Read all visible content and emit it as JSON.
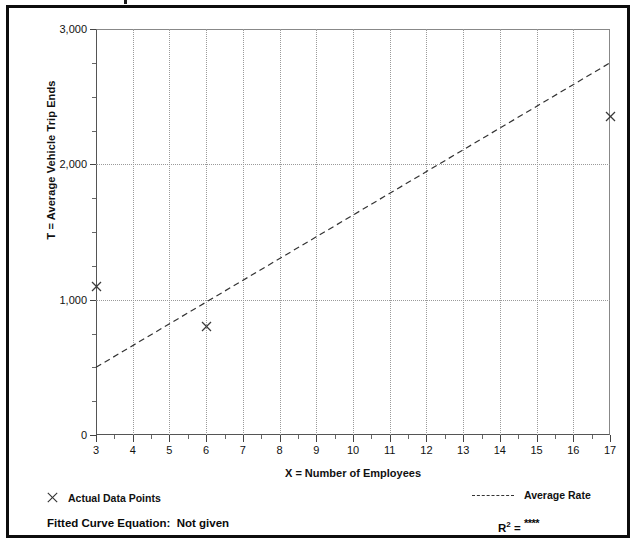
{
  "chart_data": {
    "type": "scatter",
    "title": "",
    "xlabel": "X = Number of Employees",
    "ylabel": "T = Average Vehicle Trip Ends",
    "xlim": [
      3,
      17
    ],
    "ylim": [
      0,
      3000
    ],
    "grid": true,
    "x_ticks": [
      3,
      4,
      5,
      6,
      7,
      8,
      9,
      10,
      11,
      12,
      13,
      14,
      15,
      16,
      17
    ],
    "x_tick_labels": [
      "3",
      "4",
      "5",
      "6",
      "7",
      "8",
      "9",
      "10",
      "11",
      "12",
      "13",
      "14",
      "15",
      "16",
      "17"
    ],
    "y_ticks": [
      0,
      1000,
      2000,
      3000
    ],
    "y_tick_labels": [
      "0",
      "1,000",
      "2,000",
      "3,000"
    ],
    "y_minor_ticks": [
      250,
      500,
      750,
      1250,
      1500,
      1750,
      2250,
      2500,
      2750
    ],
    "series": [
      {
        "name": "Actual Data Points",
        "type": "scatter",
        "marker": "x",
        "points": [
          {
            "x": 3,
            "y": 1100
          },
          {
            "x": 6,
            "y": 800
          },
          {
            "x": 17,
            "y": 2350
          }
        ]
      },
      {
        "name": "Average Rate",
        "type": "line",
        "style": "dashed",
        "points": [
          {
            "x": 3,
            "y": 500
          },
          {
            "x": 17,
            "y": 2750
          }
        ]
      }
    ],
    "legend_position": "below-plot",
    "annotations": {
      "fitted_curve_equation": "Fitted Curve Equation:  Not given",
      "r_squared": "****"
    },
    "colors": {
      "axis": "#444444",
      "grid": "#9a9a9a",
      "marker": "#3a3a3a",
      "trendline": "#333333",
      "frame": "#0d0d0d",
      "text": "#111111"
    }
  },
  "axes": {
    "y_label": "T = Average Vehicle Trip Ends",
    "x_label": "X = Number of Employees"
  },
  "legend": {
    "data_points_label": "Actual Data Points",
    "average_rate_label": "Average Rate",
    "data_points_marker": "x-marker-icon",
    "average_rate_marker": "dashed-line-icon"
  },
  "footer": {
    "fitted_curve_label": "Fitted Curve Equation:  Not given",
    "r_base": "R",
    "r_exponent": "2",
    "r_equals": " = ",
    "r_value": "****"
  }
}
